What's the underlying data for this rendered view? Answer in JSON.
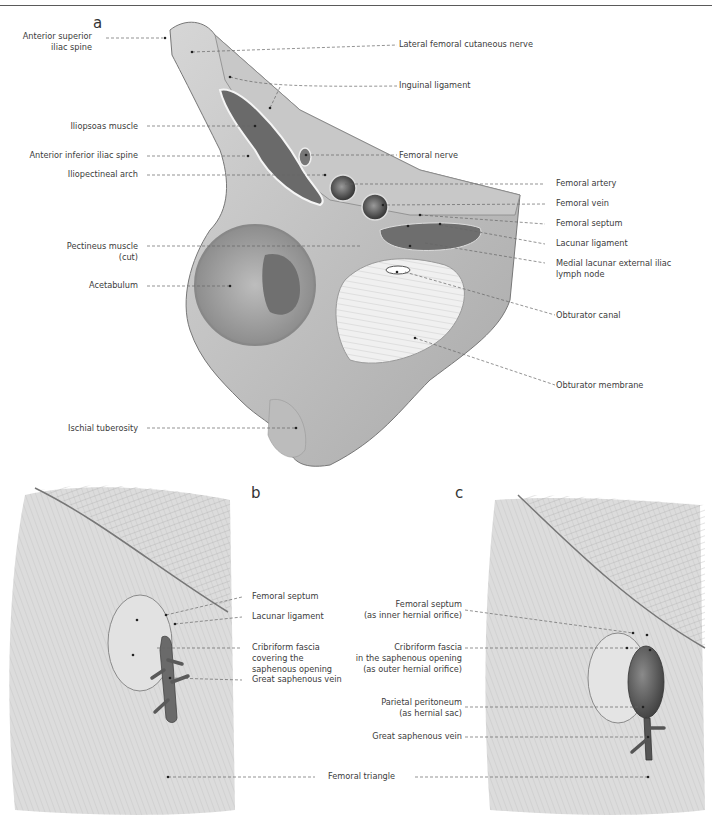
{
  "figure": {
    "panels": [
      {
        "letter": "a",
        "labels_left": [
          {
            "text": "Anterior superior",
            "text2": "iliac spine"
          },
          {
            "text": "Iliopsoas muscle"
          },
          {
            "text": "Anterior inferior iliac spine"
          },
          {
            "text": "Iliopectineal arch"
          },
          {
            "text": "Pectineus muscle",
            "text2": "(cut)"
          },
          {
            "text": "Acetabulum"
          },
          {
            "text": "Ischial tuberosity"
          }
        ],
        "labels_right": [
          {
            "text": "Lateral femoral cutaneous nerve"
          },
          {
            "text": "Inguinal ligament"
          },
          {
            "text": "Femoral nerve"
          },
          {
            "text": "Femoral artery"
          },
          {
            "text": "Femoral vein"
          },
          {
            "text": "Femoral septum"
          },
          {
            "text": "Lacunar ligament"
          },
          {
            "text": "Medial lacunar external iliac",
            "text2": "lymph node"
          },
          {
            "text": "Obturator canal"
          },
          {
            "text": "Obturator membrane"
          }
        ]
      },
      {
        "letter": "b",
        "labels_right": [
          {
            "text": "Femoral septum"
          },
          {
            "text": "Lacunar ligament"
          },
          {
            "text": "Cribriform fascia",
            "text2": "covering the",
            "text3": "saphenous opening"
          },
          {
            "text": "Great saphenous vein"
          }
        ]
      },
      {
        "letter": "c",
        "labels_left": [
          {
            "text": "Femoral septum",
            "text2": "(as inner hernial orifice)"
          },
          {
            "text": "Cribriform fascia",
            "text2": "in the saphenous opening",
            "text3": "(as outer hernial orifice)"
          },
          {
            "text": "Parietal peritoneum",
            "text2": "(as hernial sac)"
          },
          {
            "text": "Great saphenous vein"
          }
        ]
      }
    ],
    "shared_label": {
      "text": "Femoral triangle"
    }
  }
}
